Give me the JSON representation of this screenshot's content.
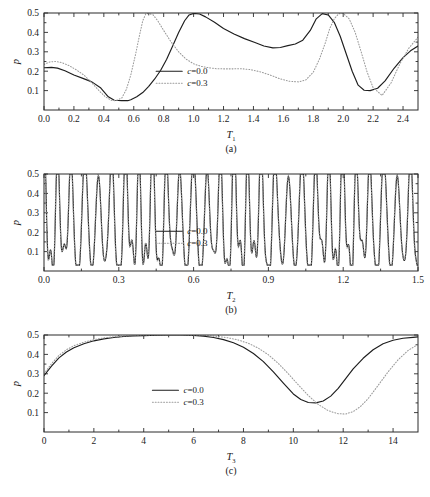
{
  "figure": {
    "title": "",
    "ylabel": "p",
    "legend": {
      "series_solid": "c=0.0",
      "series_dotted": "c=0.3",
      "position": "center"
    }
  },
  "panels": [
    {
      "id": "a",
      "caption": "(a)",
      "xlabel_base": "T",
      "xlabel_sub": "1",
      "ylabel": "p"
    },
    {
      "id": "b",
      "caption": "(b)",
      "xlabel_base": "T",
      "xlabel_sub": "2",
      "ylabel": "p"
    },
    {
      "id": "c",
      "caption": "(c)",
      "xlabel_base": "T",
      "xlabel_sub": "3",
      "ylabel": "p"
    }
  ],
  "chart_data": [
    {
      "type": "line",
      "panel": "a",
      "title": "(a)",
      "xlabel": "T_1",
      "ylabel": "p",
      "xlim": [
        0.0,
        2.5
      ],
      "ylim": [
        0.0,
        0.5
      ],
      "xticks": [
        0.0,
        0.2,
        0.4,
        0.6,
        0.8,
        1.0,
        1.2,
        1.4,
        1.6,
        1.8,
        2.0,
        2.2,
        2.4
      ],
      "xticklabels": [
        "0.0",
        "0.2",
        "0.4",
        "0.6",
        "0.8",
        "1.0",
        "1.2",
        "1.4",
        "1.6",
        "1.8",
        "2.0",
        "2.2",
        "2.4"
      ],
      "yticks": [
        0.1,
        0.2,
        0.3,
        0.4,
        0.5
      ],
      "yticklabels": [
        "0.1",
        "0.2",
        "0.3",
        "0.4",
        "0.5"
      ],
      "grid": false,
      "legend_position": "center",
      "series": [
        {
          "name": "c=0.0",
          "style": "solid",
          "color": "#1d1d1d",
          "x": [
            0.0,
            0.05,
            0.09,
            0.14,
            0.2,
            0.26,
            0.32,
            0.38,
            0.43,
            0.47,
            0.52,
            0.56,
            0.58,
            0.62,
            0.66,
            0.7,
            0.74,
            0.78,
            0.82,
            0.86,
            0.9,
            0.94,
            0.97,
            1.0,
            1.04,
            1.08,
            1.14,
            1.2,
            1.27,
            1.34,
            1.41,
            1.47,
            1.53,
            1.58,
            1.63,
            1.68,
            1.73,
            1.78,
            1.82,
            1.86,
            1.9,
            1.94,
            1.98,
            2.02,
            2.06,
            2.1,
            2.14,
            2.18,
            2.23,
            2.28,
            2.34,
            2.4,
            2.45,
            2.5
          ],
          "y": [
            0.218,
            0.22,
            0.216,
            0.202,
            0.18,
            0.163,
            0.145,
            0.113,
            0.068,
            0.05,
            0.048,
            0.048,
            0.053,
            0.068,
            0.09,
            0.122,
            0.16,
            0.205,
            0.262,
            0.33,
            0.4,
            0.46,
            0.49,
            0.498,
            0.495,
            0.48,
            0.452,
            0.42,
            0.392,
            0.368,
            0.348,
            0.33,
            0.32,
            0.322,
            0.332,
            0.34,
            0.36,
            0.41,
            0.47,
            0.497,
            0.49,
            0.452,
            0.38,
            0.29,
            0.2,
            0.128,
            0.102,
            0.1,
            0.112,
            0.15,
            0.215,
            0.27,
            0.305,
            0.33
          ]
        },
        {
          "name": "c=0.3",
          "style": "dotted",
          "color": "#9a9a9a",
          "x": [
            0.0,
            0.04,
            0.08,
            0.12,
            0.17,
            0.22,
            0.27,
            0.32,
            0.37,
            0.41,
            0.45,
            0.48,
            0.52,
            0.55,
            0.58,
            0.61,
            0.64,
            0.66,
            0.68,
            0.7,
            0.73,
            0.76,
            0.8,
            0.85,
            0.9,
            0.95,
            1.0,
            1.05,
            1.1,
            1.15,
            1.2,
            1.26,
            1.32,
            1.38,
            1.45,
            1.52,
            1.58,
            1.64,
            1.7,
            1.75,
            1.8,
            1.84,
            1.88,
            1.91,
            1.94,
            1.97,
            2.0,
            2.04,
            2.08,
            2.12,
            2.16,
            2.2,
            2.26,
            2.32,
            2.38,
            2.44,
            2.5
          ],
          "y": [
            0.235,
            0.248,
            0.25,
            0.244,
            0.228,
            0.205,
            0.178,
            0.14,
            0.098,
            0.068,
            0.05,
            0.048,
            0.062,
            0.105,
            0.18,
            0.28,
            0.39,
            0.46,
            0.495,
            0.498,
            0.49,
            0.46,
            0.41,
            0.35,
            0.3,
            0.262,
            0.238,
            0.225,
            0.218,
            0.213,
            0.212,
            0.212,
            0.213,
            0.208,
            0.196,
            0.178,
            0.16,
            0.148,
            0.145,
            0.155,
            0.195,
            0.26,
            0.345,
            0.42,
            0.47,
            0.496,
            0.498,
            0.47,
            0.4,
            0.3,
            0.195,
            0.115,
            0.075,
            0.14,
            0.24,
            0.32,
            0.375
          ]
        }
      ]
    },
    {
      "type": "line",
      "panel": "b",
      "title": "(b)",
      "xlabel": "T_2",
      "ylabel": "p",
      "xlim": [
        0.0,
        1.5
      ],
      "ylim": [
        0.0,
        0.5
      ],
      "xticks": [
        0.0,
        0.3,
        0.6,
        0.9,
        1.2,
        1.5
      ],
      "xticklabels": [
        "0.0",
        "0.3",
        "0.6",
        "0.9",
        "1.2",
        "1.5"
      ],
      "yticks": [
        0.1,
        0.2,
        0.3,
        0.4,
        0.5
      ],
      "yticklabels": [
        "0.1",
        "0.2",
        "0.3",
        "0.4",
        "0.5"
      ],
      "grid": false,
      "legend_position": "center",
      "description": "rapidly oscillating quasi-periodic signal, envelope saturating at p=0.5, deep minima near p=0.03",
      "generator": {
        "kind": "quasiperiodic",
        "samples": 1400,
        "base_period": 0.0545,
        "secondary_period": 0.0272,
        "series": [
          {
            "name": "c=0.0",
            "style": "solid",
            "color": "#1d1d1d",
            "phase": 0.0,
            "amp1": 0.27,
            "amp2": 0.15,
            "offset": 0.255,
            "clip_hi": 0.5,
            "clip_lo": 0.03
          },
          {
            "name": "c=0.3",
            "style": "dotted",
            "color": "#9a9a9a",
            "phase": 0.12,
            "amp1": 0.275,
            "amp2": 0.155,
            "offset": 0.258,
            "clip_hi": 0.5,
            "clip_lo": 0.03
          }
        ]
      }
    },
    {
      "type": "line",
      "panel": "c",
      "title": "(c)",
      "xlabel": "T_3",
      "ylabel": "p",
      "xlim": [
        0,
        15
      ],
      "ylim": [
        0.0,
        0.5
      ],
      "xticks": [
        0,
        2,
        4,
        6,
        8,
        10,
        12,
        14
      ],
      "xticklabels": [
        "0",
        "2",
        "4",
        "6",
        "8",
        "10",
        "12",
        "14"
      ],
      "yticks": [
        0.1,
        0.2,
        0.3,
        0.4,
        0.5
      ],
      "yticklabels": [
        "0.1",
        "0.2",
        "0.3",
        "0.4",
        "0.5"
      ],
      "grid": false,
      "legend_position": "center-left",
      "series": [
        {
          "name": "c=0.0",
          "style": "solid",
          "color": "#1d1d1d",
          "x": [
            0.0,
            0.3,
            0.6,
            0.9,
            1.2,
            1.6,
            2.0,
            2.4,
            2.8,
            3.2,
            3.6,
            4.0,
            4.5,
            5.0,
            5.5,
            6.0,
            6.4,
            6.8,
            7.2,
            7.6,
            8.0,
            8.4,
            8.8,
            9.2,
            9.6,
            10.0,
            10.3,
            10.6,
            10.9,
            11.2,
            11.5,
            11.8,
            12.1,
            12.4,
            12.8,
            13.2,
            13.6,
            14.0,
            14.4,
            14.8,
            15.0
          ],
          "y": [
            0.29,
            0.34,
            0.382,
            0.412,
            0.434,
            0.455,
            0.47,
            0.48,
            0.487,
            0.492,
            0.495,
            0.497,
            0.499,
            0.5,
            0.5,
            0.498,
            0.494,
            0.487,
            0.476,
            0.46,
            0.437,
            0.405,
            0.363,
            0.31,
            0.252,
            0.196,
            0.168,
            0.152,
            0.15,
            0.16,
            0.185,
            0.225,
            0.275,
            0.325,
            0.38,
            0.424,
            0.455,
            0.473,
            0.483,
            0.488,
            0.49
          ]
        },
        {
          "name": "c=0.3",
          "style": "dotted",
          "color": "#9a9a9a",
          "x": [
            0.0,
            0.3,
            0.6,
            0.9,
            1.2,
            1.6,
            2.0,
            2.4,
            2.8,
            3.2,
            3.6,
            4.0,
            4.5,
            5.0,
            5.5,
            6.0,
            6.5,
            7.0,
            7.4,
            7.8,
            8.2,
            8.6,
            9.0,
            9.4,
            9.8,
            10.2,
            10.6,
            11.0,
            11.4,
            11.8,
            12.1,
            12.4,
            12.7,
            13.0,
            13.4,
            13.8,
            14.2,
            14.6,
            15.0
          ],
          "y": [
            0.3,
            0.352,
            0.395,
            0.424,
            0.445,
            0.463,
            0.476,
            0.485,
            0.491,
            0.495,
            0.497,
            0.499,
            0.5,
            0.5,
            0.5,
            0.499,
            0.497,
            0.492,
            0.485,
            0.474,
            0.457,
            0.432,
            0.398,
            0.353,
            0.3,
            0.243,
            0.188,
            0.142,
            0.11,
            0.094,
            0.093,
            0.105,
            0.132,
            0.172,
            0.24,
            0.31,
            0.372,
            0.42,
            0.452
          ]
        }
      ]
    }
  ]
}
